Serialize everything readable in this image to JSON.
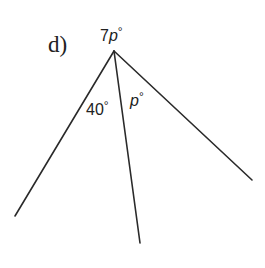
{
  "diagram": {
    "part_label": "d)",
    "vertex": {
      "x": 114,
      "y": 51
    },
    "rays": [
      {
        "name": "left",
        "end": {
          "x": 15,
          "y": 216
        }
      },
      {
        "name": "middle",
        "end": {
          "x": 140,
          "y": 243
        }
      },
      {
        "name": "right",
        "end": {
          "x": 252,
          "y": 180
        }
      }
    ],
    "angles": {
      "reflex_top": {
        "coef": "7",
        "var": "p",
        "deg": "°"
      },
      "left_middle": {
        "value": "40",
        "deg": "°"
      },
      "middle_right": {
        "var": "p",
        "deg": "°"
      }
    },
    "colors": {
      "line": "#2a2a2a",
      "text": "#222222",
      "background": "#ffffff"
    }
  }
}
